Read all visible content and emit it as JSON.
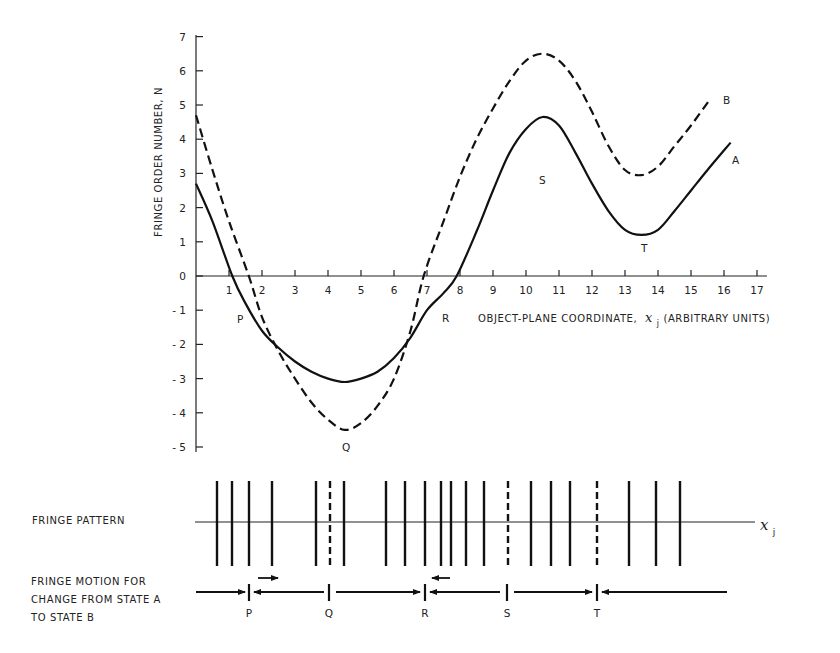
{
  "chart_data": {
    "type": "line",
    "title": "",
    "xlabel": "OBJECT-PLANE COORDINATE, x_j (ARBITRARY UNITS)",
    "ylabel": "FRINGE ORDER NUMBER, N",
    "xlim": [
      0,
      17
    ],
    "ylim": [
      -5,
      7
    ],
    "x_ticks": [
      1,
      2,
      3,
      4,
      5,
      6,
      7,
      8,
      9,
      10,
      11,
      12,
      13,
      14,
      15,
      16,
      17
    ],
    "y_ticks": [
      7,
      6,
      5,
      4,
      3,
      2,
      1,
      0,
      -1,
      -2,
      -3,
      -4,
      -5
    ],
    "grid": false,
    "series": [
      {
        "name": "A",
        "style": "solid",
        "points": [
          [
            0,
            2.7
          ],
          [
            0.5,
            1.6
          ],
          [
            1.1,
            0
          ],
          [
            1.5,
            -0.8
          ],
          [
            2,
            -1.6
          ],
          [
            2.5,
            -2.1
          ],
          [
            3,
            -2.5
          ],
          [
            3.5,
            -2.8
          ],
          [
            4,
            -3.0
          ],
          [
            4.5,
            -3.1
          ],
          [
            5,
            -3.0
          ],
          [
            5.5,
            -2.8
          ],
          [
            6,
            -2.4
          ],
          [
            6.5,
            -1.8
          ],
          [
            7,
            -1.0
          ],
          [
            7.5,
            -0.5
          ],
          [
            7.9,
            0
          ],
          [
            8.5,
            1.3
          ],
          [
            9,
            2.5
          ],
          [
            9.5,
            3.6
          ],
          [
            10,
            4.3
          ],
          [
            10.5,
            4.65
          ],
          [
            11,
            4.4
          ],
          [
            11.5,
            3.6
          ],
          [
            12,
            2.7
          ],
          [
            12.5,
            1.9
          ],
          [
            13,
            1.35
          ],
          [
            13.5,
            1.2
          ],
          [
            14,
            1.35
          ],
          [
            14.5,
            1.9
          ],
          [
            15,
            2.5
          ],
          [
            15.5,
            3.1
          ],
          [
            16.2,
            3.9
          ]
        ]
      },
      {
        "name": "B",
        "style": "dashed",
        "points": [
          [
            0,
            4.7
          ],
          [
            0.5,
            3.1
          ],
          [
            1,
            1.6
          ],
          [
            1.6,
            0
          ],
          [
            2,
            -1.2
          ],
          [
            2.5,
            -2.2
          ],
          [
            3,
            -3.0
          ],
          [
            3.5,
            -3.7
          ],
          [
            4,
            -4.2
          ],
          [
            4.5,
            -4.5
          ],
          [
            5,
            -4.3
          ],
          [
            5.5,
            -3.8
          ],
          [
            6,
            -3.0
          ],
          [
            6.5,
            -1.6
          ],
          [
            6.9,
            0
          ],
          [
            7.5,
            1.6
          ],
          [
            8,
            2.9
          ],
          [
            8.5,
            4.0
          ],
          [
            9,
            4.9
          ],
          [
            9.5,
            5.7
          ],
          [
            10,
            6.3
          ],
          [
            10.5,
            6.5
          ],
          [
            11,
            6.3
          ],
          [
            11.5,
            5.7
          ],
          [
            12,
            4.8
          ],
          [
            12.5,
            3.8
          ],
          [
            13,
            3.1
          ],
          [
            13.5,
            2.95
          ],
          [
            14,
            3.2
          ],
          [
            14.5,
            3.8
          ],
          [
            15,
            4.4
          ],
          [
            15.6,
            5.2
          ]
        ]
      }
    ],
    "annotations": [
      {
        "label": "P",
        "x": 1.4,
        "y": -1.0
      },
      {
        "label": "Q",
        "x": 4.6,
        "y": -5.0
      },
      {
        "label": "R",
        "x": 7.7,
        "y": -1.0
      },
      {
        "label": "S",
        "x": 10.4,
        "y": 3.8
      },
      {
        "label": "T",
        "x": 13.6,
        "y": 0.7
      },
      {
        "label": "A",
        "x": 16.6,
        "y": 3.4
      },
      {
        "label": "B",
        "x": 16.0,
        "y": 5.3
      }
    ]
  },
  "figure": {
    "y_axis_title": "FRINGE ORDER NUMBER, N",
    "x_axis_title_main": "OBJECT-PLANE COORDINATE,",
    "x_axis_title_var": "x",
    "x_axis_title_sub": "j",
    "x_axis_title_tail": "(ARBITRARY UNITS)",
    "curve_labels": {
      "A": "A",
      "B": "B"
    },
    "point_labels": {
      "P": "P",
      "Q": "Q",
      "R": "R",
      "S": "S",
      "T": "T"
    },
    "fringe_pattern_label": "FRINGE PATTERN",
    "fringe_axis_var": "x",
    "fringe_axis_sub": "j",
    "fringe_motion_label_lines": [
      "FRINGE MOTION FOR",
      "CHANGE FROM STATE A",
      "TO STATE B"
    ],
    "fringe_lines_px": [
      217,
      232,
      249,
      272,
      316,
      344,
      386,
      405,
      425,
      441,
      451,
      466,
      484,
      531,
      551,
      570,
      629,
      656,
      680
    ],
    "fringe_dashed_px": [
      330,
      508,
      597
    ],
    "motion_markers": [
      {
        "label": "P",
        "x_px": 249
      },
      {
        "label": "Q",
        "x_px": 329
      },
      {
        "label": "R",
        "x_px": 425
      },
      {
        "label": "S",
        "x_px": 507
      },
      {
        "label": "T",
        "x_px": 597
      }
    ]
  }
}
